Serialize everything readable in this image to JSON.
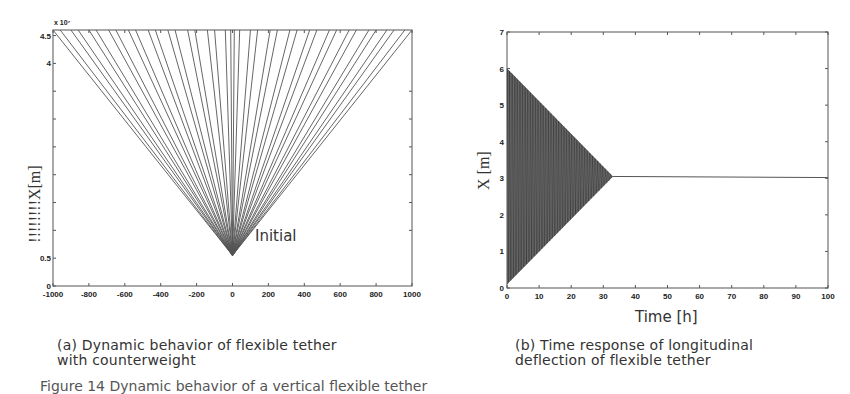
{
  "chart_data": [
    {
      "type": "line",
      "panel": "a",
      "title": "",
      "caption": "(a) Dynamic behavior of flexible tether with counterweight",
      "xlabel": "",
      "ylabel": "!!!!!!!!X[m]",
      "y_exponent_label": "x 10⁷",
      "xlim": [
        -1000,
        1000
      ],
      "ylim": [
        0,
        4.6
      ],
      "x_ticks": [
        "-1000",
        "-800",
        "-600",
        "-400",
        "-200",
        "0",
        "200",
        "400",
        "600",
        "800",
        "1000"
      ],
      "y_ticks": [
        "0",
        "0.5",
        "4",
        "4.5"
      ],
      "annotation": "Initial",
      "apex": {
        "x": 0,
        "y": 0.55
      },
      "fan_line_top_x": [
        -1000,
        -960,
        -900,
        -860,
        -800,
        -760,
        -690,
        -650,
        -580,
        -540,
        -470,
        -430,
        -360,
        -320,
        -250,
        -210,
        -140,
        -100,
        -40,
        -10,
        10,
        40,
        100,
        140,
        210,
        250,
        320,
        360,
        430,
        470,
        540,
        580,
        650,
        690,
        760,
        800,
        860,
        900,
        960,
        1000
      ],
      "fan_line_top_y": 4.6,
      "grid": false,
      "legend": null
    },
    {
      "type": "line",
      "panel": "b",
      "title": "",
      "caption": "(b) Time response of longitudinal deflection of flexible tether",
      "xlabel": "Time [h]",
      "ylabel": "X [m]",
      "xlim": [
        0,
        100
      ],
      "ylim": [
        0,
        7
      ],
      "x_ticks": [
        "0",
        "10",
        "20",
        "30",
        "40",
        "50",
        "60",
        "70",
        "80",
        "90",
        "100"
      ],
      "y_ticks": [
        "0",
        "1",
        "2",
        "3",
        "4",
        "5",
        "6",
        "7"
      ],
      "series": [
        {
          "name": "longitudinal deflection",
          "description": "dense oscillation with linearly decaying envelope converging to steady state",
          "envelope_upper": [
            [
              0,
              6.0
            ],
            [
              33,
              3.05
            ]
          ],
          "envelope_lower": [
            [
              0,
              0.1
            ],
            [
              33,
              3.05
            ]
          ],
          "steady_state": [
            [
              33,
              3.05
            ],
            [
              100,
              3.02
            ]
          ]
        }
      ],
      "grid": false,
      "legend": null
    }
  ],
  "figure_caption_partial": "Figure 14 Dynamic behavior of a vertical flexible tether"
}
